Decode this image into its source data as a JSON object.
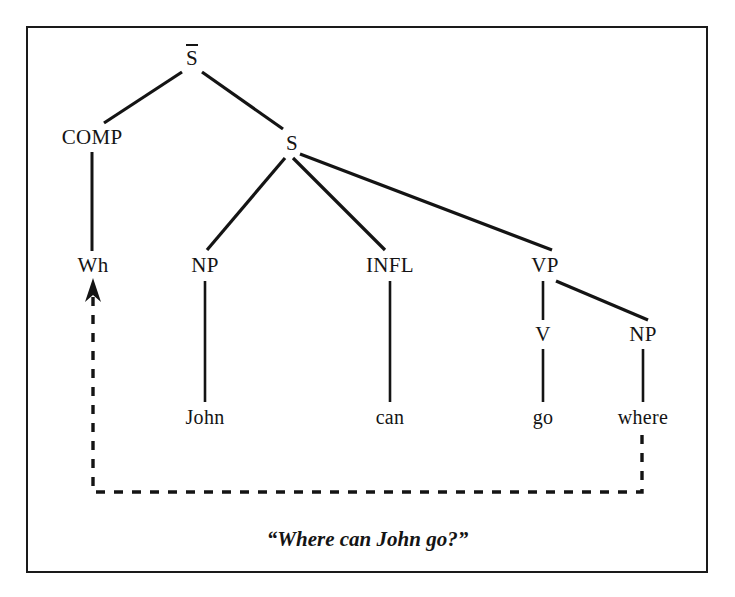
{
  "diagram": {
    "type": "syntax-tree",
    "caption": "“Where can John go?”",
    "root": {
      "label": "S",
      "overbar": true,
      "x": 192,
      "y": 58
    },
    "nodes": [
      {
        "id": "sbar",
        "label": "S",
        "overbar": true,
        "x": 192,
        "y": 58
      },
      {
        "id": "comp",
        "label": "COMP",
        "overbar": false,
        "x": 92,
        "y": 137
      },
      {
        "id": "s",
        "label": "S",
        "overbar": false,
        "x": 292,
        "y": 143
      },
      {
        "id": "wh",
        "label": "Wh",
        "overbar": false,
        "x": 93,
        "y": 265
      },
      {
        "id": "np1",
        "label": "NP",
        "overbar": false,
        "x": 205,
        "y": 265
      },
      {
        "id": "infl",
        "label": "INFL",
        "overbar": false,
        "x": 390,
        "y": 265
      },
      {
        "id": "vp",
        "label": "VP",
        "overbar": false,
        "x": 545,
        "y": 265
      },
      {
        "id": "v",
        "label": "V",
        "overbar": false,
        "x": 543,
        "y": 334
      },
      {
        "id": "np2",
        "label": "NP",
        "overbar": false,
        "x": 643,
        "y": 334
      },
      {
        "id": "john",
        "label": "John",
        "overbar": false,
        "x": 205,
        "y": 417
      },
      {
        "id": "can",
        "label": "can",
        "overbar": false,
        "x": 390,
        "y": 417
      },
      {
        "id": "go",
        "label": "go",
        "overbar": false,
        "x": 543,
        "y": 417
      },
      {
        "id": "where",
        "label": "where",
        "overbar": false,
        "x": 643,
        "y": 417
      }
    ],
    "edges": [
      {
        "from": "sbar",
        "to": "comp",
        "x1": 182,
        "y1": 72,
        "x2": 104,
        "y2": 123
      },
      {
        "from": "sbar",
        "to": "s",
        "x1": 202,
        "y1": 72,
        "x2": 283,
        "y2": 129
      },
      {
        "from": "comp",
        "to": "wh",
        "x1": 92,
        "y1": 152,
        "x2": 92,
        "y2": 251
      },
      {
        "from": "s",
        "to": "np1",
        "x1": 285,
        "y1": 158,
        "x2": 207,
        "y2": 250
      },
      {
        "from": "s",
        "to": "infl",
        "x1": 293,
        "y1": 158,
        "x2": 385,
        "y2": 250
      },
      {
        "from": "s",
        "to": "vp",
        "x1": 300,
        "y1": 154,
        "x2": 552,
        "y2": 250
      },
      {
        "from": "np1",
        "to": "john",
        "x1": 205,
        "y1": 281,
        "x2": 205,
        "y2": 402
      },
      {
        "from": "infl",
        "to": "can",
        "x1": 390,
        "y1": 281,
        "x2": 390,
        "y2": 402
      },
      {
        "from": "vp",
        "to": "v",
        "x1": 543,
        "y1": 281,
        "x2": 543,
        "y2": 320
      },
      {
        "from": "vp",
        "to": "np2",
        "x1": 556,
        "y1": 281,
        "x2": 648,
        "y2": 320
      },
      {
        "from": "v",
        "to": "go",
        "x1": 543,
        "y1": 349,
        "x2": 543,
        "y2": 402
      },
      {
        "from": "np2",
        "to": "where",
        "x1": 643,
        "y1": 349,
        "x2": 643,
        "y2": 402
      }
    ],
    "movement_arrow": {
      "label": "wh-movement",
      "from_node": "where",
      "to_node": "wh",
      "start_x": 642,
      "start_y": 435,
      "corner1_x": 642,
      "corner1_y": 492,
      "corner2_x": 93,
      "corner2_y": 492,
      "end_x": 93,
      "end_y": 290,
      "style": "dashed",
      "arrowhead": "up"
    },
    "colors": {
      "ink": "#141414",
      "frame": "#1a1a1a",
      "background": "#ffffff"
    }
  }
}
